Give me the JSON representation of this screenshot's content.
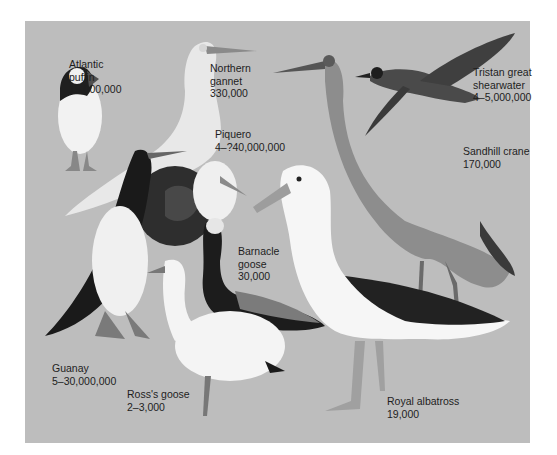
{
  "header": {
    "faint_strip_text": ""
  },
  "plate": {
    "background_color": "#bdbdbd",
    "birds": [
      {
        "id": "atlantic-puffin",
        "name_lines": [
          "Atlantic",
          "puffin"
        ],
        "population": "15,000,000"
      },
      {
        "id": "northern-gannet",
        "name_lines": [
          "Northern",
          "gannet"
        ],
        "population": "330,000"
      },
      {
        "id": "tristan-great-shearwater",
        "name_lines": [
          "Tristan great",
          "shearwater"
        ],
        "population": "4–5,000,000"
      },
      {
        "id": "piquero",
        "name_lines": [
          "Piquero"
        ],
        "population": "4–?40,000,000"
      },
      {
        "id": "sandhill-crane",
        "name_lines": [
          "Sandhill crane"
        ],
        "population": "170,000"
      },
      {
        "id": "barnacle-goose",
        "name_lines": [
          "Barnacle",
          "goose"
        ],
        "population": "30,000"
      },
      {
        "id": "guanay",
        "name_lines": [
          "Guanay"
        ],
        "population": "5–30,000,000"
      },
      {
        "id": "ross-goose",
        "name_lines": [
          "Ross's goose"
        ],
        "population": "2–3,000"
      },
      {
        "id": "royal-albatross",
        "name_lines": [
          "Royal albatross"
        ],
        "population": "19,000"
      }
    ]
  }
}
